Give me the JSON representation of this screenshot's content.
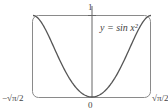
{
  "chart_data": {
    "type": "line",
    "title": "",
    "function": "y = sin x^2",
    "annotation": "y = sin x²",
    "xlabel": "",
    "ylabel": "",
    "xlim": [
      -1.2533,
      1.2533
    ],
    "ylim": [
      0,
      1
    ],
    "x_ticks": [
      "−√π/2",
      "0",
      "√π/2"
    ],
    "y_ticks": [
      "1"
    ],
    "grid": false,
    "legend": null,
    "series": [
      {
        "name": "y = sin x²",
        "x": [
          -1.2533,
          -1.1,
          -0.9,
          -0.7,
          -0.5,
          -0.3,
          0,
          0.3,
          0.5,
          0.7,
          0.9,
          1.1,
          1.2533
        ],
        "y": [
          1.0,
          0.9356,
          0.7243,
          0.4706,
          0.2474,
          0.0899,
          0.0,
          0.0899,
          0.2474,
          0.4706,
          0.7243,
          0.9356,
          1.0
        ]
      }
    ],
    "colors": {
      "curve": "#555555",
      "frame": "#777777",
      "axis": "#555555"
    }
  },
  "labels": {
    "y_top": "1",
    "x_origin": "0",
    "x_left": "−√π/2",
    "x_right": "√π/2",
    "equation": "y = sin x²"
  }
}
